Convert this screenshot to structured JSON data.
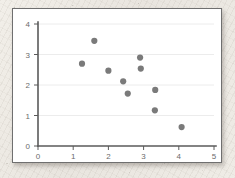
{
  "chart_data": {
    "type": "scatter",
    "title": "",
    "xlabel": "",
    "ylabel": "",
    "xlim": [
      0,
      5
    ],
    "ylim": [
      0,
      4
    ],
    "xticks": [
      0,
      1,
      2,
      3,
      4,
      5
    ],
    "yticks": [
      0,
      1,
      2,
      3,
      4
    ],
    "xtick_labels": [
      "0",
      "1",
      "2",
      "3",
      "4",
      "5"
    ],
    "ytick_labels": [
      "0",
      "1",
      "2",
      "3",
      "4"
    ],
    "grid": {
      "horizontal": true,
      "vertical": false,
      "color": "#ececec"
    },
    "legend": null,
    "marker": {
      "shape": "circle",
      "color": "#7a7a7a",
      "radius": 3.1
    },
    "axis_color": "#5a5a5a",
    "background_color": "#ffffff",
    "series": [
      {
        "name": "series-1",
        "points": [
          {
            "x": 1.25,
            "y": 2.7
          },
          {
            "x": 1.6,
            "y": 3.45
          },
          {
            "x": 2.0,
            "y": 2.47
          },
          {
            "x": 2.42,
            "y": 2.12
          },
          {
            "x": 2.55,
            "y": 1.72
          },
          {
            "x": 2.9,
            "y": 2.9
          },
          {
            "x": 2.92,
            "y": 2.54
          },
          {
            "x": 3.33,
            "y": 1.84
          },
          {
            "x": 3.32,
            "y": 1.17
          },
          {
            "x": 4.08,
            "y": 0.62
          }
        ]
      }
    ]
  }
}
